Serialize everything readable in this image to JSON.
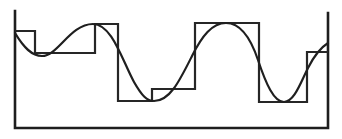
{
  "figure": {
    "colors": {
      "background": "#ffffff",
      "stroke": "#1e1e1e"
    },
    "frame": {
      "points": "15,11 15,128 328,128 328,13"
    },
    "step_function": {
      "points": "15,31 35,31 35,53 95,53 95,24 118,24 118,101 152,101 152,89 195,89 195,23 259,23 259,102 307,102 307,52 328,52"
    },
    "curve": {
      "path": "M15,33 C24,48 32,56 42,56 C58,56 70,24 93,24 C112,24 122,60 134,82 C142,96 147,101 154,101 C170,101 180,80 192,56 C202,36 212,23 226,23 C240,23 250,36 258,60 C266,84 274,102 284,102 C294,102 300,84 308,68 C314,56 320,48 328,43"
    }
  }
}
